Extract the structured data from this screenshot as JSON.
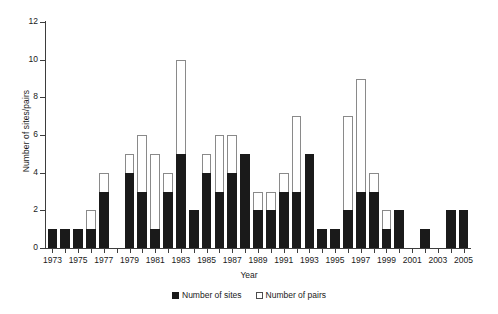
{
  "chart_data": {
    "type": "bar",
    "title": "",
    "xlabel": "Year",
    "ylabel": "Number of sites/pairs",
    "ylim": [
      0,
      12
    ],
    "ytick_values": [
      0,
      2,
      4,
      6,
      8,
      10,
      12
    ],
    "ytick_labels": [
      "0",
      "2",
      "4",
      "6",
      "8",
      "10",
      "12"
    ],
    "grid": false,
    "legend_position": "bottom-center",
    "bar_style": "overlaid",
    "categories": [
      "1973",
      "1974",
      "1975",
      "1976",
      "1977",
      "1978",
      "1979",
      "1980",
      "1981",
      "1982",
      "1983",
      "1984",
      "1985",
      "1986",
      "1987",
      "1988",
      "1989",
      "1990",
      "1991",
      "1992",
      "1993",
      "1994",
      "1995",
      "1996",
      "1997",
      "1998",
      "1999",
      "2000",
      "2001",
      "2002",
      "2003",
      "2004",
      "2005"
    ],
    "xtick_labels": [
      "1973",
      "1975",
      "1977",
      "1979",
      "1981",
      "1983",
      "1985",
      "1987",
      "1989",
      "1991",
      "1993",
      "1995",
      "1997",
      "1999",
      "2001",
      "2003",
      "2005"
    ],
    "series": [
      {
        "name": "Number of sites",
        "color": "#1a1a1a",
        "values": [
          1,
          1,
          1,
          1,
          3,
          0,
          4,
          3,
          1,
          3,
          5,
          2,
          4,
          3,
          4,
          5,
          2,
          2,
          3,
          3,
          5,
          1,
          1,
          2,
          3,
          3,
          1,
          2,
          0,
          1,
          0,
          2,
          2
        ]
      },
      {
        "name": "Number of pairs",
        "color": "#ffffff",
        "values": [
          1,
          1,
          1,
          2,
          4,
          0,
          5,
          6,
          5,
          4,
          10,
          2,
          5,
          6,
          6,
          5,
          3,
          3,
          4,
          7,
          5,
          1,
          1,
          7,
          9,
          4,
          2,
          2,
          0,
          1,
          0,
          2,
          2
        ]
      }
    ]
  },
  "legend": {
    "items": [
      {
        "label": "Number of sites",
        "swatch": "filled-black-square"
      },
      {
        "label": "Number of pairs",
        "swatch": "open-white-square"
      }
    ]
  }
}
